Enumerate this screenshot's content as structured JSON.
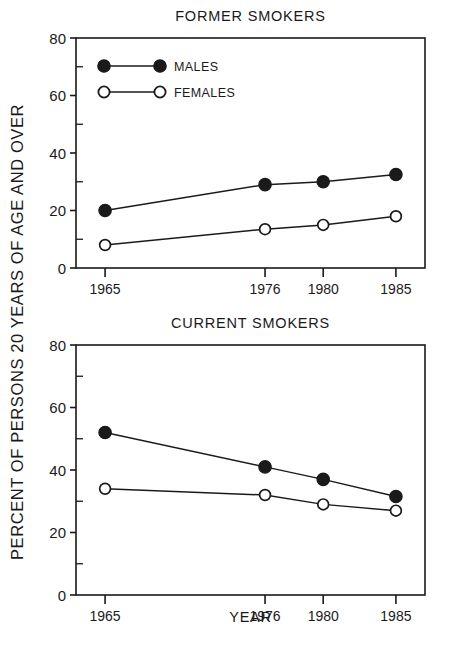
{
  "figure": {
    "width": 455,
    "height": 664,
    "background": "#ffffff",
    "ink_color": "#1a1a1a"
  },
  "axis_titles": {
    "y": "PERCENT OF PERSONS 20 YEARS OF AGE AND OVER",
    "x": "YEAR"
  },
  "legend": {
    "position": "inside-top-left-of-upper-panel",
    "entries": [
      {
        "label": "MALES",
        "marker": "filled-circle",
        "color": "#000000"
      },
      {
        "label": "FEMALES",
        "marker": "open-circle",
        "color": "#000000"
      }
    ]
  },
  "chart_data": [
    {
      "type": "line",
      "panel": "upper",
      "title": "FORMER SMOKERS",
      "xlabel": "",
      "ylabel": "PERCENT OF PERSONS 20 YEARS OF AGE AND OVER",
      "x": [
        1965,
        1976,
        1980,
        1985
      ],
      "categories": [
        "1965",
        "1976",
        "1980",
        "1985"
      ],
      "xlim": [
        1963,
        1987
      ],
      "ylim": [
        0,
        80
      ],
      "yticks": [
        0,
        20,
        40,
        60,
        80
      ],
      "yticklabels": [
        "0",
        "20",
        "40",
        "60",
        "80"
      ],
      "minor_yticks": [
        10,
        30,
        50,
        70
      ],
      "grid": false,
      "legend": [
        "MALES",
        "FEMALES"
      ],
      "series": [
        {
          "name": "MALES",
          "marker": "filled-circle",
          "values": [
            20.0,
            29.0,
            30.0,
            32.5
          ]
        },
        {
          "name": "FEMALES",
          "marker": "open-circle",
          "values": [
            8.0,
            13.5,
            15.0,
            18.0
          ]
        }
      ]
    },
    {
      "type": "line",
      "panel": "lower",
      "title": "CURRENT SMOKERS",
      "xlabel": "YEAR",
      "ylabel": "PERCENT OF PERSONS 20 YEARS OF AGE AND OVER",
      "x": [
        1965,
        1976,
        1980,
        1985
      ],
      "categories": [
        "1965",
        "1976",
        "1980",
        "1985"
      ],
      "xlim": [
        1963,
        1987
      ],
      "ylim": [
        0,
        80
      ],
      "yticks": [
        0,
        20,
        40,
        60,
        80
      ],
      "yticklabels": [
        "0",
        "20",
        "40",
        "60",
        "80"
      ],
      "minor_yticks": [
        10,
        30,
        50,
        70
      ],
      "grid": false,
      "legend": [],
      "series": [
        {
          "name": "MALES",
          "marker": "filled-circle",
          "values": [
            52.0,
            41.0,
            37.0,
            31.5
          ]
        },
        {
          "name": "FEMALES",
          "marker": "open-circle",
          "values": [
            34.0,
            32.0,
            29.0,
            27.0
          ]
        }
      ]
    }
  ]
}
